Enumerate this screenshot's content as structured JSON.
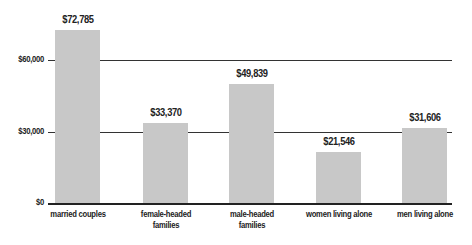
{
  "chart_data": {
    "type": "bar",
    "title": "",
    "xlabel": "",
    "ylabel": "",
    "categories": [
      "married couples",
      "female-headed families",
      "male-headed families",
      "women living alone",
      "men living alone"
    ],
    "category_lines": [
      [
        "married couples"
      ],
      [
        "female-headed",
        "families"
      ],
      [
        "male-headed",
        "families"
      ],
      [
        "women living alone"
      ],
      [
        "men living alone"
      ]
    ],
    "values": [
      72785,
      33370,
      49839,
      21546,
      31606
    ],
    "value_labels": [
      "$72,785",
      "$33,370",
      "$49,839",
      "$21,546",
      "$31,606"
    ],
    "ylim": [
      0,
      75000
    ],
    "yticks": [
      0,
      30000,
      60000
    ],
    "ytick_labels": [
      "$0",
      "$30,000",
      "$60,000"
    ],
    "grid": true,
    "legend": null,
    "bar_color": "#c8c8c8",
    "grid_color": "#333333"
  }
}
